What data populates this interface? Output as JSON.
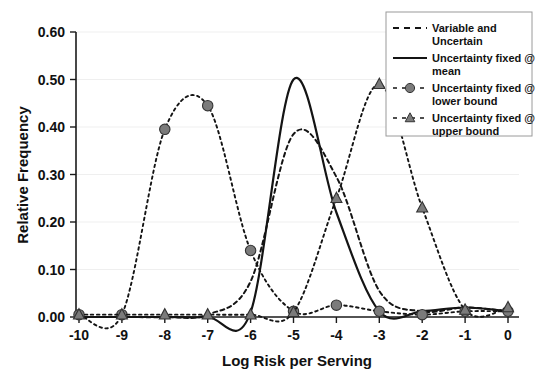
{
  "chart_data": {
    "type": "line",
    "title": "",
    "xlabel": "Log Risk per Serving",
    "ylabel": "Relative Frequency",
    "xlim": [
      -10,
      0
    ],
    "ylim": [
      0.0,
      0.6
    ],
    "xticks": [
      "-10",
      "-9",
      "-8",
      "-7",
      "-6",
      "-5",
      "-4",
      "-3",
      "-2",
      "-1",
      "0"
    ],
    "xtick_values": [
      -10,
      -9,
      -8,
      -7,
      -6,
      -5,
      -4,
      -3,
      -2,
      -1,
      0
    ],
    "yticks": [
      "0.00",
      "0.10",
      "0.20",
      "0.30",
      "0.40",
      "0.50",
      "0.60"
    ],
    "ytick_values": [
      0.0,
      0.1,
      0.2,
      0.3,
      0.4,
      0.5,
      0.6
    ],
    "grid": true,
    "legend_position": "top-right",
    "x": [
      -10,
      -9,
      -8,
      -7,
      -6,
      -5,
      -4,
      -3,
      -2,
      -1,
      0
    ],
    "series": [
      {
        "name": "Variable and Uncertain",
        "style": "dashed",
        "marker": "none",
        "color": "#141414",
        "values": [
          0.0,
          0.0,
          0.0,
          0.005,
          0.075,
          0.385,
          0.295,
          0.055,
          0.012,
          0.02,
          0.012
        ]
      },
      {
        "name": "Uncertainty fixed @ mean",
        "style": "solid",
        "marker": "none",
        "color": "#141414",
        "values": [
          0.0,
          0.0,
          0.0,
          0.0,
          0.01,
          0.5,
          0.22,
          0.012,
          0.012,
          0.02,
          0.012
        ]
      },
      {
        "name": "Uncertainty fixed @ lower bound",
        "style": "dashed",
        "marker": "circle",
        "color": "#6f6f6f",
        "values": [
          0.005,
          0.005,
          0.395,
          0.445,
          0.14,
          0.012,
          0.025,
          0.012,
          0.005,
          0.012,
          0.012
        ]
      },
      {
        "name": "Uncertainty fixed @ upper bound",
        "style": "dashed",
        "marker": "triangle",
        "color": "#6f6f6f",
        "values": [
          0.005,
          0.005,
          0.005,
          0.005,
          0.005,
          0.01,
          0.25,
          0.49,
          0.23,
          0.015,
          0.02
        ]
      }
    ]
  },
  "legend": {
    "entries": [
      {
        "label_line1": "Variable and",
        "label_line2": "Uncertain",
        "sample": "dashed"
      },
      {
        "label_line1": "Uncertainty fixed @",
        "label_line2": "mean",
        "sample": "solid"
      },
      {
        "label_line1": "Uncertainty fixed @",
        "label_line2": "lower bound",
        "sample": "dashed-circle"
      },
      {
        "label_line1": "Uncertainty fixed @",
        "label_line2": "upper bound",
        "sample": "dashed-triangle"
      }
    ]
  }
}
